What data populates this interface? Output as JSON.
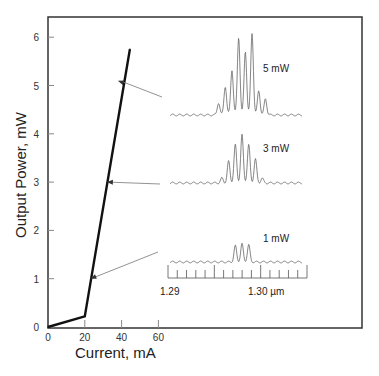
{
  "chart_data": {
    "type": "line",
    "title": "",
    "xlabel": "Current, mA",
    "ylabel": "Output Power, mW",
    "xlim": [
      0,
      170
    ],
    "ylim": [
      0,
      6.4
    ],
    "xticks": [
      0,
      20,
      40,
      60
    ],
    "yticks": [
      0,
      1,
      2,
      3,
      4,
      5,
      6
    ],
    "grid": false,
    "series": [
      {
        "name": "L-I curve",
        "x": [
          0,
          20,
          44.5
        ],
        "y": [
          0,
          0.22,
          5.75
        ]
      }
    ],
    "insets": [
      {
        "label": "5 mW",
        "arrow_to": {
          "x": 38,
          "y": 5.1
        },
        "peak_heights": [
          0.15,
          0.35,
          0.55,
          0.95,
          0.78,
          1.0,
          0.3,
          0.2
        ],
        "position": "top-right"
      },
      {
        "label": "3 mW",
        "arrow_to": {
          "x": 32,
          "y": 3.0
        },
        "peak_heights": [
          0.1,
          0.45,
          0.8,
          1.0,
          0.8,
          0.5,
          0.1
        ],
        "position": "middle-right"
      },
      {
        "label": "1 mW",
        "arrow_to": {
          "x": 23,
          "y": 1.0
        },
        "peak_heights": [
          0.9,
          1.0,
          0.95
        ],
        "position": "lower-right"
      }
    ],
    "wavelength_scale": {
      "tick_labels": [
        "1.29",
        "1.30 µm"
      ],
      "range_um": [
        1.29,
        1.305
      ]
    }
  }
}
